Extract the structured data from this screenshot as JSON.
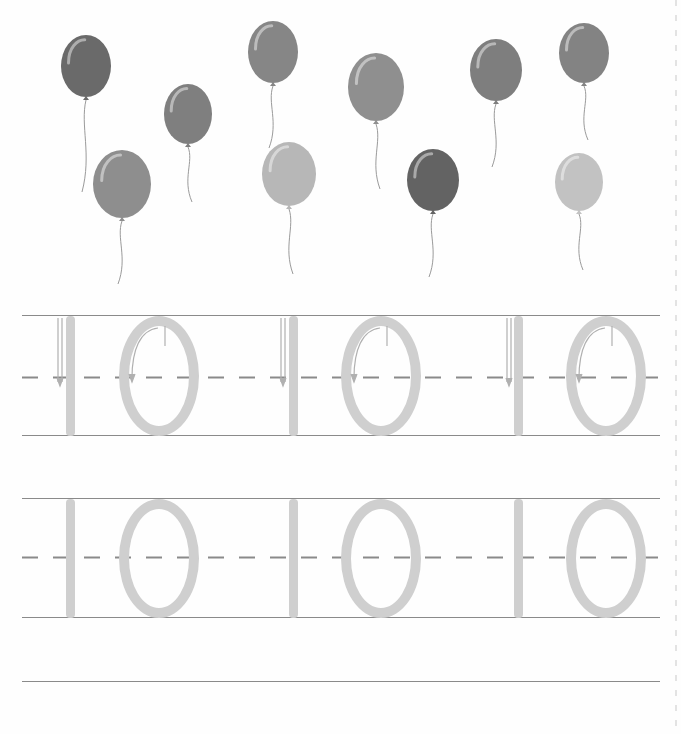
{
  "worksheet": {
    "number": "10",
    "balloon_count": 10,
    "trace_rows": [
      {
        "digits": [
          "1",
          "0",
          "1",
          "0",
          "1",
          "0"
        ],
        "guides": "arrows"
      },
      {
        "digits": [
          "1",
          "0",
          "1",
          "0",
          "1",
          "0"
        ],
        "guides": "none"
      }
    ]
  },
  "colors": {
    "trace_gray": "#cfcfcf",
    "rule_gray": "#8a8a8a",
    "arrow_gray": "#b8b8b8"
  },
  "balloons": [
    {
      "x": 86,
      "y": 66,
      "rx": 25,
      "ry": 31,
      "fill": "#6a6a6a",
      "string_len": 95
    },
    {
      "x": 188,
      "y": 114,
      "rx": 24,
      "ry": 30,
      "fill": "#7f7f7f",
      "string_len": 58
    },
    {
      "x": 273,
      "y": 52,
      "rx": 25,
      "ry": 31,
      "fill": "#868686",
      "string_len": 65
    },
    {
      "x": 376,
      "y": 87,
      "rx": 28,
      "ry": 34,
      "fill": "#8f8f8f",
      "string_len": 68
    },
    {
      "x": 496,
      "y": 70,
      "rx": 26,
      "ry": 31,
      "fill": "#7e7e7e",
      "string_len": 66
    },
    {
      "x": 584,
      "y": 53,
      "rx": 25,
      "ry": 30,
      "fill": "#838383",
      "string_len": 57
    },
    {
      "x": 122,
      "y": 184,
      "rx": 29,
      "ry": 34,
      "fill": "#8e8e8e",
      "string_len": 66
    },
    {
      "x": 289,
      "y": 174,
      "rx": 27,
      "ry": 32,
      "fill": "#b7b7b7",
      "string_len": 68
    },
    {
      "x": 433,
      "y": 180,
      "rx": 26,
      "ry": 31,
      "fill": "#636363",
      "string_len": 66
    },
    {
      "x": 579,
      "y": 182,
      "rx": 24,
      "ry": 29,
      "fill": "#c2c2c2",
      "string_len": 59
    }
  ]
}
